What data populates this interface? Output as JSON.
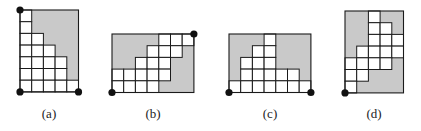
{
  "colors": {
    "background": "#ffffff",
    "shaded": "#c9c9c9",
    "cell_white": "#ffffff",
    "grid_line": "#1a1a1a",
    "dot": "#111111"
  },
  "cell_size": 11.7,
  "figures": [
    {
      "id": "a",
      "label": "(a)",
      "label_x": 49,
      "origin": [
        20,
        10
      ],
      "cols": 5,
      "rows": 7,
      "white_cells_by_row": [
        [
          0
        ],
        [
          0
        ],
        [
          0,
          1
        ],
        [
          0,
          1,
          2
        ],
        [
          0,
          1,
          2,
          3
        ],
        [
          0,
          1,
          2,
          3
        ],
        [
          0,
          1,
          2,
          3,
          4
        ]
      ],
      "dots": [
        "top-left",
        "bottom-left",
        "bottom-right"
      ]
    },
    {
      "id": "b",
      "label": "(b)",
      "label_x": 153,
      "origin": [
        112,
        34
      ],
      "cols": 7,
      "rows": 5,
      "white_cells_by_row": [
        [
          4,
          5,
          6
        ],
        [
          3,
          4,
          5
        ],
        [
          2,
          3,
          4
        ],
        [
          0,
          1,
          2,
          3,
          4
        ],
        [
          0,
          1,
          2,
          3
        ]
      ],
      "dots": [
        "top-right",
        "bottom-left"
      ]
    },
    {
      "id": "c",
      "label": "(c)",
      "label_x": 270,
      "origin": [
        229,
        34
      ],
      "cols": 7,
      "rows": 5,
      "white_cells_by_row": [
        [
          3
        ],
        [
          2,
          3
        ],
        [
          1,
          2,
          3
        ],
        [
          1,
          2,
          3,
          4,
          5
        ],
        [
          0,
          1,
          2,
          3,
          4,
          5,
          6
        ]
      ],
      "dots": [
        "bottom-left",
        "bottom-right"
      ]
    },
    {
      "id": "d",
      "label": "(d)",
      "label_x": 374,
      "origin": [
        345,
        11
      ],
      "cols": 5,
      "rows": 7,
      "white_cells_by_row": [
        [
          2
        ],
        [
          2,
          3
        ],
        [
          2,
          3,
          4
        ],
        [
          1,
          2,
          3,
          4
        ],
        [
          0,
          1,
          2,
          3
        ],
        [
          0,
          1
        ],
        [
          0
        ]
      ],
      "dots": [
        "bottom-left"
      ]
    }
  ]
}
